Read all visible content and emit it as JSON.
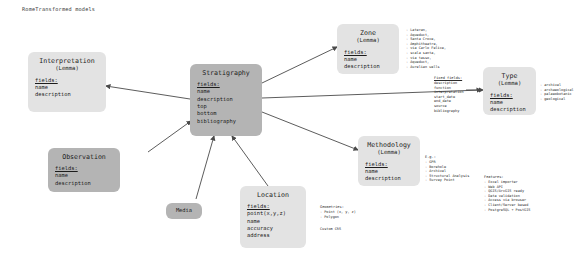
{
  "diagram": {
    "title": "RomeTransformed models",
    "type": "entity-relationship",
    "background_color": "#ffffff",
    "node_fill_dark": "#b4b4b4",
    "node_fill_light": "#e3e3e3",
    "edge_color": "#4a4a4a"
  },
  "nodes": {
    "interpretation": {
      "title": "Interpretation",
      "subtitle": "(Lemma)",
      "fields_label": "fields:",
      "fields": [
        "name",
        "description"
      ]
    },
    "stratigraphy": {
      "title": "Stratigraphy",
      "subtitle": "",
      "fields_label": "fields:",
      "fields": [
        "name",
        "description",
        "top",
        "bottom",
        "bibliography"
      ]
    },
    "zone": {
      "title": "Zone",
      "subtitle": "(Lemma)",
      "fields_label": "fields:",
      "fields": [
        "name",
        "description"
      ]
    },
    "type": {
      "title": "Type",
      "subtitle": "(Lemma)",
      "fields_label": "fields:",
      "fields": [
        "name",
        "description"
      ]
    },
    "methodology": {
      "title": "Methodology",
      "subtitle": "(Lemma)",
      "fields_label": "fields:",
      "fields": [
        "name",
        "description"
      ]
    },
    "observation": {
      "title": "Observation",
      "subtitle": "",
      "fields_label": "fields:",
      "fields": [
        "name",
        "description"
      ]
    },
    "location": {
      "title": "Location",
      "subtitle": "",
      "fields_label": "fields:",
      "fields": [
        "point(x,y,z)",
        "name",
        "accuracy",
        "address"
      ]
    },
    "media": {
      "title": "Media",
      "subtitle": "",
      "fields_label": "",
      "fields": []
    }
  },
  "annotations": {
    "zone_examples": {
      "items": [
        "Lateran,",
        "Aqueduct,",
        "Santa Croce,",
        "Amphitheatre,",
        "via Carlo Felice,",
        "scala santa,",
        "via tasso,",
        "Aqueduct,",
        "Aurelian walls"
      ]
    },
    "fixed_fields": {
      "head": "Fixed fields:",
      "items": [
        "description",
        "function",
        "interpretation",
        "start_date",
        "end_date",
        "source",
        "bibliography"
      ]
    },
    "type_examples": {
      "items": [
        "archival",
        "archaeological",
        "palaeobotanic",
        "geological"
      ]
    },
    "methodology_examples": {
      "head": "E.g.:",
      "items": [
        "GPR",
        "Borehole",
        "Archival",
        "Structural Analysis",
        "Survey Point"
      ]
    },
    "geometries": {
      "head": "Geometries:",
      "items": [
        "Point (x, y, z)",
        "Polygon"
      ],
      "footer": "Custom CRS"
    },
    "features": {
      "head": "Features:",
      "items": [
        "Excel importer",
        "Web API",
        "QGIS/ArcGIS ready",
        "Data validation",
        "Access via browser",
        "Client/Server based",
        "PostgreSQL + PostGIS"
      ]
    }
  }
}
